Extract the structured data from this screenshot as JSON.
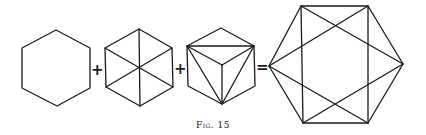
{
  "figure": {
    "caption": "Fig. 15",
    "operators": [
      "+",
      "+",
      "="
    ],
    "panels": [
      {
        "name": "hexagon-outline",
        "description": "Regular hexagon outline"
      },
      {
        "name": "hexagon-with-diagonals",
        "description": "Hexagon with three main diagonals through the center"
      },
      {
        "name": "hexagon-cube-projection",
        "description": "Hexagon with cube-like inner edges and triangle diagonals"
      },
      {
        "name": "hexagon-complete",
        "description": "Large hexagon with vertical edges and crossing diagonals"
      }
    ],
    "stroke_color": "#1a1a1a",
    "background": "#ffffff"
  }
}
